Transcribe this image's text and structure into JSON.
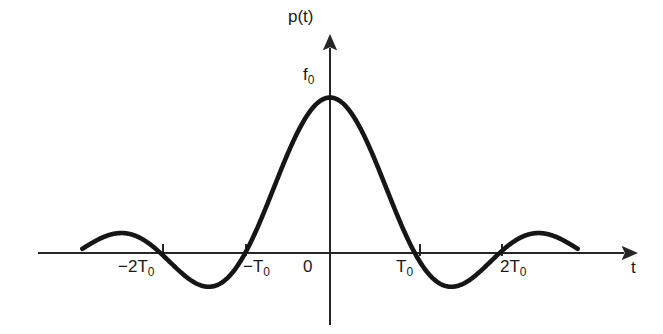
{
  "figure": {
    "title": "",
    "background_color": "#ffffff",
    "curve_color": "#161616",
    "axis_color": "#262626",
    "text_color": "#1a1a1a"
  },
  "labels": {
    "y_axis": {
      "text": "p(t)",
      "name": "y-axis-label"
    },
    "peak_value": {
      "base": "f",
      "sub": "0",
      "name": "peak-amplitude-label"
    },
    "x_axis": {
      "text": "t",
      "name": "x-axis-label"
    },
    "ticks": [
      {
        "base": "−2T",
        "sub": "0",
        "value": -2
      },
      {
        "base": "−T",
        "sub": "0",
        "value": -1
      },
      {
        "base": "0",
        "sub": "",
        "value": 0
      },
      {
        "base": "T",
        "sub": "0",
        "value": 1
      },
      {
        "base": "2T",
        "sub": "0",
        "value": 2
      }
    ]
  },
  "chart_data": {
    "type": "line",
    "title": "",
    "xlabel": "t",
    "ylabel": "p(t)",
    "function": "sinc",
    "equation": "p(t) = f0 * sin(pi*t/T0) / (pi*t/T0)",
    "grid": false,
    "legend": null,
    "xlim": [
      -2.95,
      2.95
    ],
    "ylim": [
      -0.28,
      1.12
    ],
    "x_tick_labels": [
      "−2T₀",
      "−T₀",
      "0",
      "T₀",
      "2T₀"
    ],
    "x_tick_values": [
      -2,
      -1,
      0,
      1,
      2
    ],
    "y_tick_labels": [
      "f₀"
    ],
    "y_tick_values": [
      1
    ],
    "x_unit": "T0",
    "peak_amplitude_label": "f₀",
    "peak_amplitude": 1,
    "zero_crossings": [
      -2,
      -1,
      1,
      2
    ],
    "local_extrema": [
      {
        "x": -2.46,
        "y": 0.128,
        "kind": "max"
      },
      {
        "x": -1.43,
        "y": -0.217,
        "kind": "min"
      },
      {
        "x": 0,
        "y": 1.0,
        "kind": "max"
      },
      {
        "x": 1.43,
        "y": -0.217,
        "kind": "min"
      },
      {
        "x": 2.46,
        "y": 0.128,
        "kind": "max"
      }
    ],
    "curve_x_range": [
      -2.92,
      2.92
    ],
    "series": [
      {
        "name": "p(t)",
        "x": [
          -2.92,
          -2.8,
          -2.7,
          -2.6,
          -2.5,
          -2.4,
          -2.3,
          -2.2,
          -2.1,
          -2.0,
          -1.9,
          -1.8,
          -1.7,
          -1.6,
          -1.5,
          -1.4,
          -1.3,
          -1.2,
          -1.1,
          -1.0,
          -0.9,
          -0.8,
          -0.7,
          -0.6,
          -0.5,
          -0.4,
          -0.3,
          -0.2,
          -0.1,
          0.0,
          0.1,
          0.2,
          0.3,
          0.4,
          0.5,
          0.6,
          0.7,
          0.8,
          0.9,
          1.0,
          1.1,
          1.2,
          1.3,
          1.4,
          1.5,
          1.6,
          1.7,
          1.8,
          1.9,
          2.0,
          2.1,
          2.2,
          2.3,
          2.4,
          2.5,
          2.6,
          2.7,
          2.8,
          2.92
        ],
        "y": [
          0.027,
          0.068,
          0.093,
          0.112,
          0.127,
          0.127,
          0.116,
          0.094,
          0.061,
          0.0,
          -0.052,
          -0.108,
          -0.161,
          -0.189,
          -0.212,
          -0.216,
          -0.202,
          -0.156,
          -0.09,
          0.0,
          0.109,
          0.234,
          0.368,
          0.505,
          0.637,
          0.757,
          0.858,
          0.935,
          0.984,
          1.0,
          0.984,
          0.935,
          0.858,
          0.757,
          0.637,
          0.505,
          0.368,
          0.234,
          0.109,
          0.0,
          -0.09,
          -0.156,
          -0.202,
          -0.216,
          -0.212,
          -0.189,
          -0.161,
          -0.108,
          -0.052,
          0.0,
          0.061,
          0.094,
          0.116,
          0.127,
          0.127,
          0.112,
          0.093,
          0.068,
          0.027
        ]
      }
    ]
  }
}
